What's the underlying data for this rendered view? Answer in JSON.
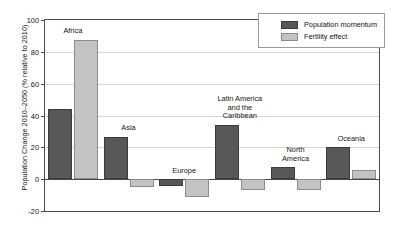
{
  "chart_data": {
    "type": "bar",
    "title": "",
    "xlabel": "",
    "ylabel": "Population Change 2010–2050 (% relative to 2010)",
    "ylim": [
      -20,
      100
    ],
    "ytick_step": 20,
    "yticks": [
      100,
      80,
      60,
      40,
      20,
      0,
      -20
    ],
    "grid": true,
    "legend_position": "top-right",
    "categories": [
      "Africa",
      "Asia",
      "Europe",
      "Latin America and the Caribbean",
      "North America",
      "Oceania"
    ],
    "category_label_lines": [
      [
        "Africa"
      ],
      [
        "Asia"
      ],
      [
        "Europe"
      ],
      [
        "Latin America",
        "and the",
        "Caribbean"
      ],
      [
        "North",
        "America"
      ],
      [
        "Oceania"
      ]
    ],
    "series": [
      {
        "name": "Population momentum",
        "color": "#585858",
        "values": [
          44,
          26.5,
          -4.5,
          34,
          7.5,
          20
        ]
      },
      {
        "name": "Fertility effect",
        "color": "#c3c3c3",
        "values": [
          87.5,
          -5,
          -11,
          -7,
          -6.5,
          5.5
        ]
      }
    ]
  },
  "legend": {
    "items": [
      {
        "label": "Population momentum",
        "swatch": "momentum"
      },
      {
        "label": "Fertility effect",
        "swatch": "fertility"
      }
    ]
  },
  "axis": {
    "tick_labels": [
      "100",
      "80",
      "60",
      "40",
      "20",
      "0",
      "-20"
    ]
  }
}
